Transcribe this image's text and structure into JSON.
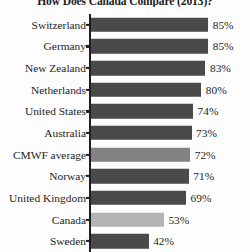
{
  "chart_data": {
    "type": "bar",
    "orientation": "horizontal",
    "title": "How Does Canada Compare (2013)?",
    "xlabel": "",
    "ylabel": "",
    "xlim": [
      0,
      100
    ],
    "grid": false,
    "legend": false,
    "value_suffix": "%",
    "categories": [
      "Switzerland",
      "Germany",
      "New Zealand",
      "Netherlands",
      "United States",
      "Australia",
      "CMWF average",
      "Norway",
      "United Kingdom",
      "Canada",
      "Sweden"
    ],
    "values": [
      85,
      85,
      83,
      80,
      74,
      73,
      72,
      71,
      69,
      53,
      42
    ],
    "value_labels": [
      "85%",
      "85%",
      "83%",
      "80%",
      "74%",
      "73%",
      "72%",
      "71%",
      "69%",
      "53%",
      "42%"
    ],
    "bar_colors": [
      "#4a4a4a",
      "#4a4a4a",
      "#4a4a4a",
      "#4a4a4a",
      "#4a4a4a",
      "#4a4a4a",
      "#828282",
      "#4a4a4a",
      "#4a4a4a",
      "#b4b4b4",
      "#4a4a4a"
    ],
    "colors": {
      "default_bar": "#4a4a4a",
      "average_bar": "#828282",
      "highlight_bar": "#b4b4b4",
      "axis": "#1f1f1f",
      "text": "#1e1e1e",
      "background": "#fdfdfd"
    }
  }
}
